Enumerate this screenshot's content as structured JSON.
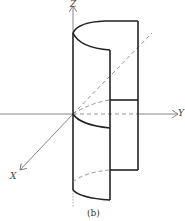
{
  "figure": {
    "caption": "(b)",
    "axes": {
      "z_label": "Z",
      "y_label": "Y",
      "x_label": "X"
    },
    "colors": {
      "stroke": "#222222",
      "axis": "#777777",
      "dashed": "#888888"
    }
  }
}
